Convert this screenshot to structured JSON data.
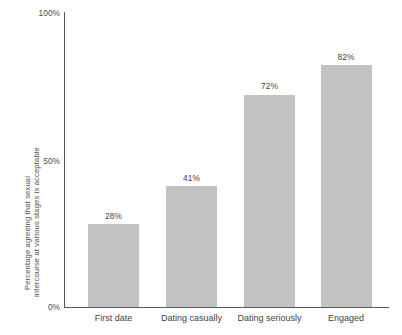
{
  "chart_data": {
    "type": "bar",
    "title": "",
    "subtitle": "",
    "xlabel": "",
    "ylabel_line1": "Percentage agreeing that sexual",
    "ylabel_line2": "intercourse at various stages is acceptable",
    "categories": [
      "First date",
      "Dating casually",
      "Dating seriously",
      "Engaged"
    ],
    "values": [
      28,
      41,
      72,
      82
    ],
    "value_labels": [
      "28%",
      "41%",
      "72%",
      "82%"
    ],
    "ylim": [
      0,
      100
    ],
    "yticks": [
      0,
      50,
      100
    ],
    "ytick_labels": [
      "0%",
      "50%",
      "100%"
    ],
    "grid": false,
    "legend": null,
    "series": [
      {
        "name": "Percentage agreeing",
        "values": [
          28,
          41,
          72,
          82
        ]
      }
    ],
    "colors": {
      "bar_fill": "#c2c2c2",
      "axis": "#58585a",
      "text": "#3f3f3f",
      "background": "#ffffff"
    }
  }
}
